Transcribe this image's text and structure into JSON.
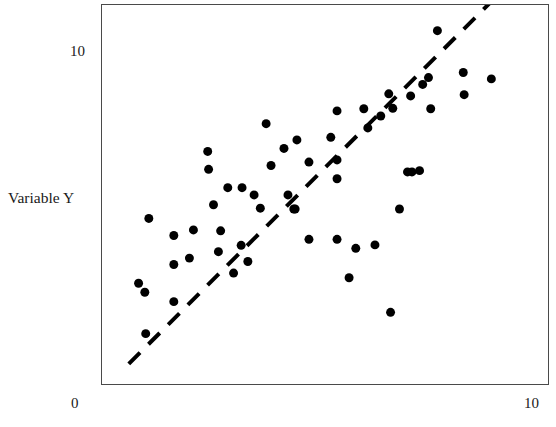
{
  "chart_data": {
    "type": "scatter",
    "title": "",
    "xlabel": "",
    "ylabel": "Variable Y",
    "xlim": [
      0,
      10
    ],
    "ylim": [
      0,
      10
    ],
    "grid": false,
    "legend": null,
    "x_ticks": [
      {
        "value": 0,
        "label": "0"
      },
      {
        "value": 10,
        "label": "10"
      }
    ],
    "y_ticks": [
      {
        "value": 10,
        "label": "10"
      }
    ],
    "marker": {
      "shape": "circle",
      "color": "#000000",
      "size_px": 9
    },
    "points": [
      {
        "x": 0.82,
        "y": 2.36
      },
      {
        "x": 0.96,
        "y": 2.15
      },
      {
        "x": 0.98,
        "y": 1.18
      },
      {
        "x": 1.05,
        "y": 3.88
      },
      {
        "x": 1.61,
        "y": 1.93
      },
      {
        "x": 1.61,
        "y": 2.8
      },
      {
        "x": 1.61,
        "y": 3.48
      },
      {
        "x": 1.96,
        "y": 2.95
      },
      {
        "x": 2.05,
        "y": 3.61
      },
      {
        "x": 2.37,
        "y": 5.45
      },
      {
        "x": 2.39,
        "y": 5.03
      },
      {
        "x": 2.5,
        "y": 4.2
      },
      {
        "x": 2.61,
        "y": 3.1
      },
      {
        "x": 2.66,
        "y": 3.59
      },
      {
        "x": 2.82,
        "y": 4.6
      },
      {
        "x": 2.95,
        "y": 2.6
      },
      {
        "x": 3.12,
        "y": 3.25
      },
      {
        "x": 3.14,
        "y": 4.6
      },
      {
        "x": 3.27,
        "y": 2.87
      },
      {
        "x": 3.41,
        "y": 4.43
      },
      {
        "x": 3.55,
        "y": 4.12
      },
      {
        "x": 3.68,
        "y": 6.1
      },
      {
        "x": 3.79,
        "y": 5.12
      },
      {
        "x": 4.08,
        "y": 5.52
      },
      {
        "x": 4.17,
        "y": 4.43
      },
      {
        "x": 4.3,
        "y": 4.1
      },
      {
        "x": 4.33,
        "y": 4.1
      },
      {
        "x": 4.37,
        "y": 5.72
      },
      {
        "x": 4.64,
        "y": 3.39
      },
      {
        "x": 4.64,
        "y": 5.2
      },
      {
        "x": 5.13,
        "y": 5.78
      },
      {
        "x": 5.27,
        "y": 6.4
      },
      {
        "x": 5.27,
        "y": 5.25
      },
      {
        "x": 5.27,
        "y": 4.81
      },
      {
        "x": 5.27,
        "y": 3.39
      },
      {
        "x": 5.54,
        "y": 2.49
      },
      {
        "x": 5.69,
        "y": 3.18
      },
      {
        "x": 5.87,
        "y": 6.45
      },
      {
        "x": 5.96,
        "y": 6.0
      },
      {
        "x": 6.12,
        "y": 3.26
      },
      {
        "x": 6.25,
        "y": 6.28
      },
      {
        "x": 6.43,
        "y": 6.8
      },
      {
        "x": 6.47,
        "y": 1.68
      },
      {
        "x": 6.52,
        "y": 6.46
      },
      {
        "x": 6.67,
        "y": 4.1
      },
      {
        "x": 6.85,
        "y": 4.97
      },
      {
        "x": 6.92,
        "y": 6.75
      },
      {
        "x": 6.95,
        "y": 4.97
      },
      {
        "x": 7.12,
        "y": 5.0
      },
      {
        "x": 7.19,
        "y": 7.02
      },
      {
        "x": 7.32,
        "y": 7.18
      },
      {
        "x": 7.37,
        "y": 6.45
      },
      {
        "x": 7.52,
        "y": 8.28
      },
      {
        "x": 8.1,
        "y": 7.3
      },
      {
        "x": 8.12,
        "y": 6.78
      },
      {
        "x": 8.73,
        "y": 7.15
      }
    ],
    "trend_line": {
      "style": "dashed",
      "color": "#000000",
      "width_px": 4,
      "x_start": 0.6,
      "y_start": 0.47,
      "x_end": 8.86,
      "y_end": 9.1
    }
  },
  "labels": {
    "y_axis_title": "Variable Y",
    "y_tick_top": "10",
    "x_tick_left": "0",
    "x_tick_right": "10"
  }
}
